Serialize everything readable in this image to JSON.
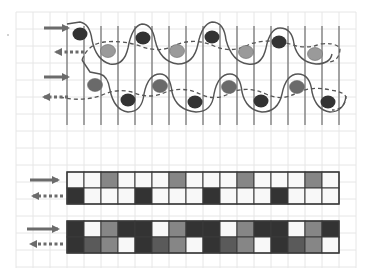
{
  "diagram": {
    "colors": {
      "background": "#ffffff",
      "grid_line": "#e6e6e6",
      "warp_line": "#6e6e6e",
      "weft_line": "#555555",
      "arrow": "#6b6b6b",
      "dark": "#333333",
      "mid_dark": "#5a5a5a",
      "gray": "#868686",
      "light_gray": "#9a9a9a",
      "white": "#f8f8f8",
      "cell_border": "#3a3a3a"
    },
    "background_grid": {
      "x0": 16,
      "y0": 12,
      "x1": 356,
      "y1": 268,
      "step": 17
    },
    "weave_section": {
      "warp_lines": {
        "x_start": 67,
        "step": 17,
        "count": 17,
        "y_top": 26,
        "y_bottom": 125
      },
      "rows": [
        {
          "name": "top-weave-pair",
          "solid_arrow": {
            "x1": 44,
            "y": 28,
            "x2": 68,
            "direction": "right"
          },
          "dashed_arrow": {
            "x1": 84,
            "y": 52,
            "x2": 56,
            "direction": "left"
          },
          "dark_dots": [
            [
              80,
              34
            ],
            [
              143,
              38
            ],
            [
              212,
              37
            ],
            [
              279,
              42
            ]
          ],
          "gray_dots": [
            [
              108,
              51
            ],
            [
              177,
              51
            ],
            [
              246,
              52
            ],
            [
              315,
              54
            ]
          ]
        },
        {
          "name": "bottom-weave-pair",
          "solid_arrow": {
            "x1": 44,
            "y": 77,
            "x2": 68,
            "direction": "right"
          },
          "dashed_arrow": {
            "x1": 68,
            "y": 97,
            "x2": 44,
            "direction": "left"
          },
          "gray_dots": [
            [
              95,
              85
            ],
            [
              160,
              86
            ],
            [
              229,
              87
            ],
            [
              297,
              87
            ]
          ],
          "dark_dots": [
            [
              128,
              100
            ],
            [
              195,
              102
            ],
            [
              261,
              101
            ],
            [
              328,
              102
            ]
          ]
        }
      ]
    },
    "grids": [
      {
        "name": "plain-pattern-grid",
        "x": 67,
        "y": 172,
        "cell": 17,
        "cols": 16,
        "solid_arrow": {
          "x1": 30,
          "y": 180,
          "x2": 58,
          "direction": "right"
        },
        "dashed_arrow": {
          "x1": 63,
          "y": 196,
          "x2": 33,
          "direction": "left"
        },
        "rows": [
          [
            "W",
            "W",
            "G",
            "W",
            "W",
            "W",
            "G",
            "W",
            "W",
            "W",
            "G",
            "W",
            "W",
            "W",
            "G",
            "W"
          ],
          [
            "D",
            "W",
            "W",
            "W",
            "D",
            "W",
            "W",
            "W",
            "D",
            "W",
            "W",
            "W",
            "D",
            "W",
            "W",
            "W"
          ]
        ]
      },
      {
        "name": "dense-pattern-grid",
        "x": 67,
        "y": 221,
        "cell": 17,
        "cols": 16,
        "solid_arrow": {
          "x1": 27,
          "y": 229,
          "x2": 58,
          "direction": "right"
        },
        "dashed_arrow": {
          "x1": 63,
          "y": 244,
          "x2": 31,
          "direction": "left"
        },
        "rows": [
          [
            "D",
            "W",
            "G",
            "D",
            "D",
            "W",
            "G",
            "D",
            "D",
            "W",
            "G",
            "D",
            "D",
            "W",
            "G",
            "D"
          ],
          [
            "D",
            "M",
            "G",
            "W",
            "D",
            "M",
            "G",
            "W",
            "D",
            "M",
            "G",
            "W",
            "D",
            "M",
            "G",
            "W"
          ]
        ]
      }
    ],
    "legend_stray_dot": {
      "x": 8,
      "y": 35
    }
  }
}
